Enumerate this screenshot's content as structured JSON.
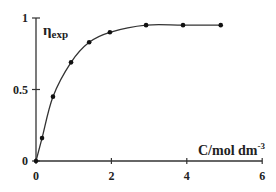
{
  "chart_data": {
    "type": "line",
    "title": "",
    "xlabel": "C/mol dm-3",
    "xlabel_main": "C/mol dm",
    "xlabel_sup": "-3",
    "ylabel": "η_exp",
    "ylabel_main": "η",
    "ylabel_sub": "exp",
    "xlim": [
      0,
      6
    ],
    "ylim": [
      0,
      1
    ],
    "x_ticks": [
      0,
      2,
      4,
      6
    ],
    "x_tick_labels": [
      "0",
      "2",
      "4",
      "6"
    ],
    "y_ticks": [
      0,
      0.5,
      1
    ],
    "y_tick_labels": [
      "0",
      "0.5",
      "1"
    ],
    "grid": false,
    "legend": null,
    "series": [
      {
        "name": "η_exp",
        "marker": "dot",
        "line": "smooth",
        "x": [
          0,
          0.16,
          0.45,
          0.93,
          1.41,
          1.96,
          2.92,
          3.9,
          4.9
        ],
        "y": [
          0,
          0.16,
          0.45,
          0.69,
          0.83,
          0.9,
          0.95,
          0.95,
          0.95
        ]
      }
    ]
  }
}
